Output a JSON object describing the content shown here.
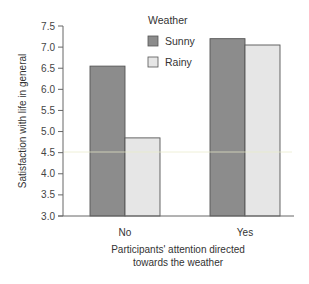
{
  "chart_data": {
    "type": "bar",
    "title": "",
    "xlabel": "Participants' attention directed towards the weather",
    "xlabel_lines": [
      "Participants' attention directed",
      "towards the weather"
    ],
    "ylabel": "Satisfaction with life in general",
    "categories": [
      "No",
      "Yes"
    ],
    "series": [
      {
        "name": "Sunny",
        "values": [
          6.55,
          7.2
        ],
        "color": "#8c8c8c"
      },
      {
        "name": "Rainy",
        "values": [
          4.85,
          7.05
        ],
        "color": "#e6e6e6"
      }
    ],
    "ylim": [
      3.0,
      7.5
    ],
    "yticks": [
      3.0,
      3.5,
      4.0,
      4.5,
      5.0,
      5.5,
      6.0,
      6.5,
      7.0,
      7.5
    ],
    "ytick_labels": [
      "3.0",
      "3.5",
      "4.0",
      "4.5",
      "5.0",
      "5.5",
      "6.0",
      "6.5",
      "7.0",
      "7.5"
    ],
    "grid": false,
    "legend": {
      "title": "Weather",
      "position": "upper-center",
      "entries": [
        "Sunny",
        "Rainy"
      ]
    }
  },
  "colors": {
    "bar_border": "#555555",
    "axis": "#666666"
  }
}
